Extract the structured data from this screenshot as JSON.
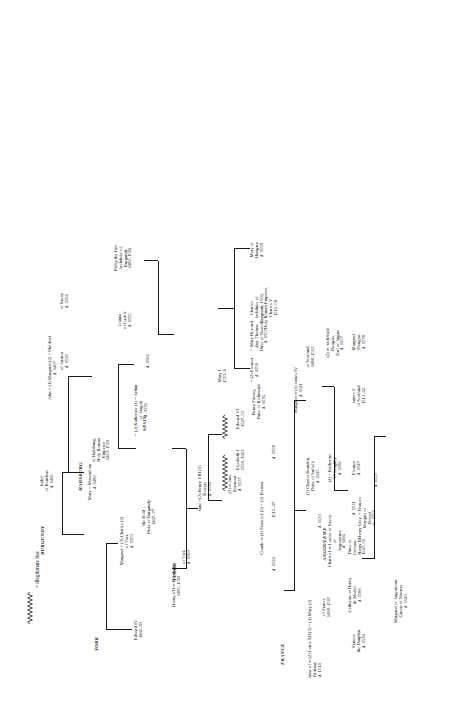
{
  "document": {
    "title": "The Royal Houses of Europe.",
    "orientation": "landscape-rotated-90ccw",
    "legend_label": "= illegitimate line",
    "legend_icon": "zigzag-line"
  },
  "houses": [
    {
      "id": "york",
      "label": "YORK"
    },
    {
      "id": "burgundy",
      "label": "BURGUNDY"
    },
    {
      "id": "habsburg",
      "label": "HABSBURG"
    },
    {
      "id": "spain",
      "label": "SPAIN"
    },
    {
      "id": "tudor",
      "label": "TUDOR"
    },
    {
      "id": "france",
      "label": "FRANCE"
    },
    {
      "id": "angouleme",
      "label": "ANGOULEME"
    }
  ],
  "people": [
    {
      "id": "edward-iv",
      "lines": [
        "Edward IV",
        "1461–83"
      ]
    },
    {
      "id": "margaret-york",
      "lines": [
        "Margaret  =  (3) Charles (2)",
        "of York",
        "d. 1503"
      ]
    },
    {
      "id": "charles-bold",
      "lines": [
        "‘the Bold’,",
        "Duke of Burgundy",
        "1467–77"
      ]
    },
    {
      "id": "isabel-bourbon",
      "lines": [
        "Isabel",
        "of Bourbon",
        "d. 1465"
      ]
    },
    {
      "id": "mary-burgundy",
      "lines": [
        "Mary  =  Maximilian",
        "d. 1482"
      ]
    },
    {
      "id": "maximilian",
      "lines": [
        "of Habsburg,",
        "Holy Roman",
        "Emperor",
        "1493–1519"
      ]
    },
    {
      "id": "henry-vii",
      "lines": [
        "Henry VII ═ Elizabeth",
        "1485–1509"
      ]
    },
    {
      "id": "elizabeth-york",
      "lines": [
        "of York",
        "d. 1503"
      ]
    },
    {
      "id": "john-1497",
      "lines": [
        "John  = (1) Margaret (2) = Philibert",
        "d. 1497"
      ]
    },
    {
      "id": "margaret-austria",
      "lines": [
        "of Austria",
        "d. 1530"
      ]
    },
    {
      "id": "philibert-savoy",
      "lines": [
        "of Savoy",
        "d. 1504"
      ]
    },
    {
      "id": "katherine-aragon",
      "lines": [
        "= (2) Katherine (1) = Arthur",
        "of Aragon",
        "d. 1536"
      ]
    },
    {
      "id": "arthur",
      "lines": [
        "d. 1502"
      ]
    },
    {
      "id": "henry-viii",
      "lines": [
        "(2) Henry VIII (1)",
        "1509–47"
      ]
    },
    {
      "id": "anne-boleyn",
      "lines": [
        "Anne  =(2)  Henry VIII (1)",
        "Boleyn",
        "d. 1536"
      ]
    },
    {
      "id": "jane-seymour",
      "lines": [
        "(3) ═ Jane",
        "Seymour",
        "d. 1537"
      ]
    },
    {
      "id": "elizabeth-i",
      "lines": [
        "Elizabeth I",
        "1558–1603"
      ]
    },
    {
      "id": "edward-vi",
      "lines": [
        "Edward VI",
        "1547–53"
      ]
    },
    {
      "id": "mary-i",
      "lines": [
        "Mary I",
        "1553–8"
      ]
    },
    {
      "id": "henry-fitzroy",
      "lines": [
        "Henry Fitzroy,",
        "Duke of Richmond",
        "d. 1536"
      ]
    },
    {
      "id": "mary-howard",
      "lines": [
        "=  Mary Howard",
        "dau. Thomas",
        "Duke of Norfolk",
        "d. 1557"
      ]
    },
    {
      "id": "joanna-castile",
      "lines": [
        "Joanna",
        "of Castile",
        "d. 1555"
      ]
    },
    {
      "id": "philip-fair",
      "lines": [
        "Philip the Fair",
        "Archduke of,",
        "Burgundy",
        "1482–1506"
      ]
    },
    {
      "id": "charles-v",
      "lines": [
        "Charles",
        "Archduke of",
        "Burgundy 1506,",
        "Holy Roman Emperor,",
        "Charles V",
        "1519–58"
      ]
    },
    {
      "id": "mary-hungary",
      "lines": [
        "Mary of",
        "Hungary",
        "d. 1558"
      ]
    },
    {
      "id": "eleanor",
      "lines": [
        "= (2) Eleanor",
        "d. 1558"
      ]
    },
    {
      "id": "anne-brittany",
      "lines": [
        "Anne of  ═ (2) Louis XII (3) = (1) Mary (2)",
        "Brittany",
        "d. 1514"
      ]
    },
    {
      "id": "louis-xii",
      "lines": [
        "of France",
        "1498–1515"
      ]
    },
    {
      "id": "mary-tudor",
      "lines": [
        "d. 1533"
      ]
    },
    {
      "id": "charles-brandon",
      "lines": [
        "(3) Charles Brandon,",
        "Duke of Suffolk",
        "d. 1545"
      ]
    },
    {
      "id": "katherine-willoughby",
      "lines": [
        "(4) = Katherine",
        "Willoughby",
        "d. 1580"
      ]
    },
    {
      "id": "margaret-tudor",
      "lines": [
        "Margaret  ═ (1) James IV",
        "d. 1541"
      ]
    },
    {
      "id": "james-iv",
      "lines": [
        "of Scotland",
        "1488–1513"
      ]
    },
    {
      "id": "archibald-douglas",
      "lines": [
        "(2) ═ Archibald",
        "Douglas,",
        "Earl of Angus",
        "d. 1557"
      ]
    },
    {
      "id": "james-v",
      "lines": [
        "James V",
        "of Scotland",
        "1513–42"
      ]
    },
    {
      "id": "margaret-douglas",
      "lines": [
        "Margaret",
        "Douglas",
        "d. 1578"
      ]
    },
    {
      "id": "eleanor-1547",
      "lines": [
        "Eleanor",
        "d. 1547"
      ]
    },
    {
      "id": "frances",
      "lines": [
        "Henry Grey, = Frances",
        "Marquis of",
        "Dorset",
        "ex. 1554"
      ]
    },
    {
      "id": "frances-d",
      "lines": [
        "d. 1559"
      ]
    },
    {
      "id": "claude",
      "lines": [
        "Claude  ═ (1) Francis I (2) = (2) Eleanor"
      ]
    },
    {
      "id": "claude-d",
      "lines": [
        "d. 1524"
      ]
    },
    {
      "id": "francis-i",
      "lines": [
        "1515–47"
      ]
    },
    {
      "id": "eleanor-1558",
      "lines": [
        "d. 1558"
      ]
    },
    {
      "id": "louise-savoy",
      "lines": [
        "Charles I ═ Louise of Savoy",
        "of",
        "Angouleme",
        "d. 1496"
      ]
    },
    {
      "id": "louise-d",
      "lines": [
        "d. 1531"
      ]
    },
    {
      "id": "catherine-medici",
      "lines": [
        "Catherine ═ Henry",
        "de Medici",
        "d. 1589"
      ]
    },
    {
      "id": "henry-ii",
      "lines": [
        "Duke of",
        "Orleans,",
        "Henry II",
        "1547–59"
      ]
    },
    {
      "id": "francis-dauphin",
      "lines": [
        "Francis",
        "the Dauphin",
        "d. 1536"
      ]
    },
    {
      "id": "margaret-navarre",
      "lines": [
        "Margaret of Angouleme",
        "Queen of Navarre",
        "d. 1549"
      ]
    }
  ]
}
